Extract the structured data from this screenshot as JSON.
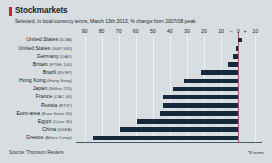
{
  "header": {
    "title": "Stockmarkets",
    "subtitle": "Selected, in local-currency terms, March 13th 2013, % change from 2007/08 peak",
    "accent_color": "#d4202c"
  },
  "footer": {
    "source": "Source: Thomson Reuters",
    "footnote": "*$ terms"
  },
  "chart_data": {
    "type": "bar",
    "orientation": "horizontal",
    "title": "Stockmarkets",
    "subtitle": "Selected, in local-currency terms, March 13th 2013, % change from 2007/08 peak",
    "xlabel": "",
    "ylabel": "",
    "xlim": [
      -95,
      14
    ],
    "axis_direction": "reversed",
    "grid": true,
    "legend": null,
    "bar_color": "#16293c",
    "zero_line_color": "#9b5a63",
    "ticks": [
      {
        "label": "90",
        "value": -90
      },
      {
        "label": "80",
        "value": -80
      },
      {
        "label": "70",
        "value": -70
      },
      {
        "label": "60",
        "value": -60
      },
      {
        "label": "50",
        "value": -50
      },
      {
        "label": "40",
        "value": -40
      },
      {
        "label": "30",
        "value": -30
      },
      {
        "label": "20",
        "value": -20
      },
      {
        "label": "10",
        "value": -10
      },
      {
        "label": "–",
        "value": -4
      },
      {
        "label": "0",
        "value": 0
      },
      {
        "label": "+",
        "value": 4
      },
      {
        "label": "10",
        "value": 10
      }
    ],
    "categories": [
      "United States (DJIA)",
      "United States (S&P 500)",
      "Germany (DAX)",
      "Britain (FTSE 100)",
      "Brazil (BVSP)",
      "Hong Kong (Hang Seng)",
      "Japan (Nikkei 225)",
      "France (CAC 40)",
      "Russia (RTS*)",
      "Euro-area (Euro Stoxx 50)",
      "Egypt (Case 30)",
      "China (SSEA)",
      "Greece (Athex Comp)"
    ],
    "bars": [
      {
        "country": "United States",
        "index": "(DJIA)",
        "value": 2
      },
      {
        "country": "United States",
        "index": "(S&P 500)",
        "value": -1
      },
      {
        "country": "Germany",
        "index": "(DAX)",
        "value": -3
      },
      {
        "country": "Britain",
        "index": "(FTSE 100)",
        "value": -6
      },
      {
        "country": "Russia-spacer",
        "index": "",
        "value": 0
      }
    ],
    "values": [
      2,
      -1,
      -3,
      -6,
      -22,
      -32,
      -38,
      -44,
      -44,
      -46,
      -59,
      -69,
      -85
    ]
  }
}
